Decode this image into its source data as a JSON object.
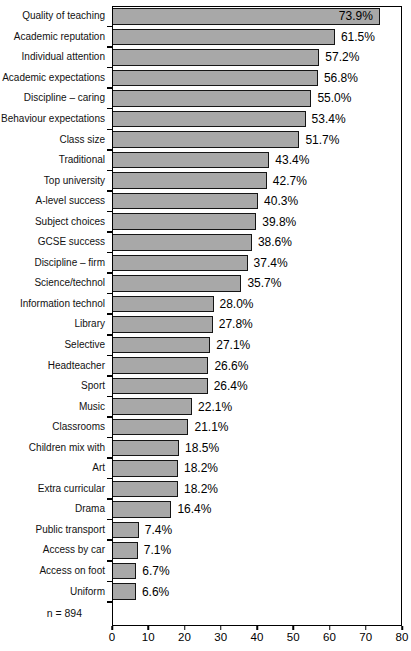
{
  "chart_data": {
    "type": "bar",
    "orientation": "horizontal",
    "title": "",
    "categories": [
      "Quality of teaching",
      "Academic reputation",
      "Individual attention",
      "Academic expectations",
      "Discipline – caring",
      "Behaviour expectations",
      "Class size",
      "Traditional",
      "Top university",
      "A-level success",
      "Subject choices",
      "GCSE success",
      "Discipline – firm",
      "Science/technol",
      "Information technol",
      "Library",
      "Selective",
      "Headteacher",
      "Sport",
      "Music",
      "Classrooms",
      "Children mix with",
      "Art",
      "Extra curricular",
      "Drama",
      "Public transport",
      "Access by car",
      "Access on foot",
      "Uniform"
    ],
    "values": [
      73.9,
      61.5,
      57.2,
      56.8,
      55.0,
      53.4,
      51.7,
      43.4,
      42.7,
      40.3,
      39.8,
      38.6,
      37.4,
      35.7,
      28.0,
      27.8,
      27.1,
      26.6,
      26.4,
      22.1,
      21.1,
      18.5,
      18.2,
      18.2,
      16.4,
      7.4,
      7.1,
      6.7,
      6.6
    ],
    "value_labels": [
      "73.9%",
      "61.5%",
      "57.2%",
      "56.8%",
      "55.0%",
      "53.4%",
      "51.7%",
      "43.4%",
      "42.7%",
      "40.3%",
      "39.8%",
      "38.6%",
      "37.4%",
      "35.7%",
      "28.0%",
      "27.8%",
      "27.1%",
      "26.6%",
      "26.4%",
      "22.1%",
      "21.1%",
      "18.5%",
      "18.2%",
      "18.2%",
      "16.4%",
      "7.4%",
      "7.1%",
      "6.7%",
      "6.6%"
    ],
    "note": "n = 894",
    "xlabel": "",
    "ylabel": "",
    "xlim": [
      0,
      80
    ],
    "x_ticks": [
      0,
      10,
      20,
      30,
      40,
      50,
      60,
      70,
      80
    ],
    "grid": false,
    "legend": false,
    "colors": {
      "bar_fill": "#a8a8a8",
      "bar_border": "#151515",
      "axis": "#000000",
      "background": "#ffffff"
    },
    "layout": {
      "inside_label_min_fraction": 0.85
    }
  }
}
